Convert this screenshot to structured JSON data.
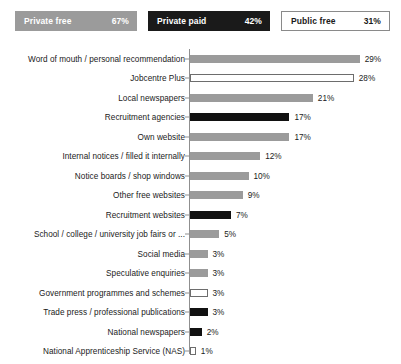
{
  "legend": {
    "items": [
      {
        "name": "private-free",
        "label": "Private free",
        "value": "67%",
        "color": "#9b9b9b",
        "style": "filled-gray"
      },
      {
        "name": "private-paid",
        "label": "Private paid",
        "value": "42%",
        "color": "#1a1a1a",
        "style": "filled-black"
      },
      {
        "name": "public-free",
        "label": "Public free",
        "value": "31%",
        "color": "#ffffff",
        "style": "outlined-white"
      }
    ]
  },
  "chart_data": {
    "type": "bar",
    "orientation": "horizontal",
    "title": "",
    "subtitle": "",
    "xlabel": "",
    "ylabel": "",
    "xlim": [
      0,
      30
    ],
    "grid": false,
    "legend_position": "top",
    "value_suffix": "%",
    "px_per_unit": 5.85,
    "categories": [
      "Word of mouth / personal recommendation",
      "Jobcentre Plus",
      "Local newspapers",
      "Recruitment agencies",
      "Own website",
      "Internal notices / filled it internally",
      "Notice boards / shop windows",
      "Other free websites",
      "Recruitment websites",
      "School / college / university job fairs or ...",
      "Social media",
      "Speculative enquiries",
      "Government programmes and schemes",
      "Trade press / professional publications",
      "National newspapers",
      "National Apprenticeship Service (NAS)"
    ],
    "values": [
      29,
      28,
      21,
      17,
      17,
      12,
      10,
      9,
      7,
      5,
      3,
      3,
      3,
      3,
      2,
      1
    ],
    "labels": [
      "29%",
      "28%",
      "21%",
      "17%",
      "17%",
      "12%",
      "10%",
      "9%",
      "7%",
      "5%",
      "3%",
      "3%",
      "3%",
      "3%",
      "2%",
      "1%"
    ],
    "series_of": [
      "private-free",
      "public-free",
      "private-free",
      "private-paid",
      "private-free",
      "private-free",
      "private-free",
      "private-free",
      "private-paid",
      "private-free",
      "private-free",
      "private-free",
      "public-free",
      "private-paid",
      "private-paid",
      "public-free"
    ]
  }
}
